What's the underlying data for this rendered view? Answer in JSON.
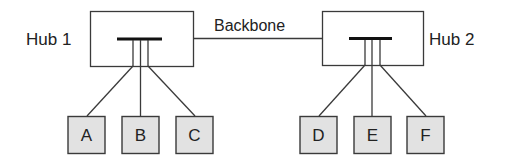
{
  "diagram": {
    "type": "network-topology",
    "hubs": [
      {
        "label": "Hub 1"
      },
      {
        "label": "Hub 2"
      }
    ],
    "backbone": {
      "label": "Backbone"
    },
    "nodes": [
      {
        "label": "A",
        "hub": "Hub 1"
      },
      {
        "label": "B",
        "hub": "Hub 1"
      },
      {
        "label": "C",
        "hub": "Hub 1"
      },
      {
        "label": "D",
        "hub": "Hub 2"
      },
      {
        "label": "E",
        "hub": "Hub 2"
      },
      {
        "label": "F",
        "hub": "Hub 2"
      }
    ],
    "colors": {
      "node_fill": "#e2e2e2",
      "stroke": "#3a3a3a",
      "bar": "#111111"
    }
  }
}
